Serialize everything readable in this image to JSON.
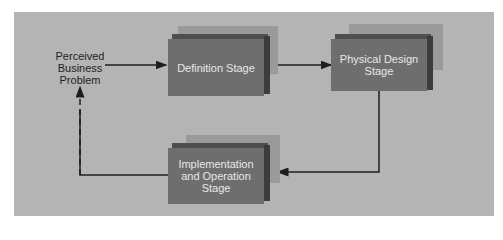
{
  "diagram": {
    "start_label": "Perceived\nBusiness\nProblem",
    "stages": [
      {
        "id": "definition",
        "label": "Definition Stage"
      },
      {
        "id": "physical-design",
        "label": "Physical Design\nStage"
      },
      {
        "id": "implementation",
        "label": "Implementation\nand Operation\nStage"
      }
    ],
    "colors": {
      "background": "#b4b4b4",
      "box_face": "#6e6e6e",
      "box_text": "#e8e8e8",
      "arrow": "#1e1e1e"
    }
  }
}
